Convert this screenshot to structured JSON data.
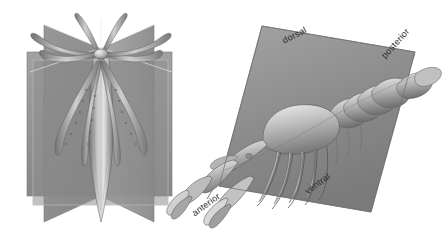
{
  "figure": {
    "background_color": "#ffffff",
    "panels": [
      {
        "id": "radial-symmetry-panel",
        "symmetry_type": "radial",
        "organism": "squid",
        "plane_count": 4,
        "plane_color": "#8a8a8a",
        "body_color": "#9a9a9a",
        "labels": []
      },
      {
        "id": "bilateral-symmetry-panel",
        "symmetry_type": "bilateral",
        "organism": "crayfish",
        "plane_count": 1,
        "plane_color": "#8f8f8f",
        "body_color": "#a5a5a5",
        "labels": [
          {
            "id": "dorsal",
            "text": "dorsal",
            "rotation_deg": -27
          },
          {
            "id": "posterior",
            "text": "posterior",
            "rotation_deg": -48
          },
          {
            "id": "ventral",
            "text": "ventral",
            "rotation_deg": -36
          },
          {
            "id": "anterior",
            "text": "anterior",
            "rotation_deg": -36
          }
        ]
      }
    ],
    "label_color": "#2a2a2a"
  }
}
